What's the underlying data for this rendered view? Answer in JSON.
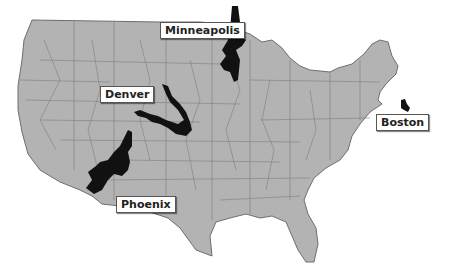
{
  "map": {
    "region": "Contiguous United States",
    "base_fill": "#b3b3b3",
    "border_color": "#6e6e6e",
    "highlight_fill": "#111111",
    "background": "#ffffff"
  },
  "labels": [
    {
      "id": "minneapolis",
      "text": "Minneapolis",
      "x": 160,
      "y": 22
    },
    {
      "id": "denver",
      "text": "Denver",
      "x": 100,
      "y": 86
    },
    {
      "id": "boston",
      "text": "Boston",
      "x": 376,
      "y": 114
    },
    {
      "id": "phoenix",
      "text": "Phoenix",
      "x": 116,
      "y": 196
    }
  ],
  "highlighted_regions": [
    {
      "id": "minneapolis",
      "label": "Minneapolis"
    },
    {
      "id": "denver",
      "label": "Denver"
    },
    {
      "id": "boston",
      "label": "Boston"
    },
    {
      "id": "phoenix",
      "label": "Phoenix"
    }
  ]
}
